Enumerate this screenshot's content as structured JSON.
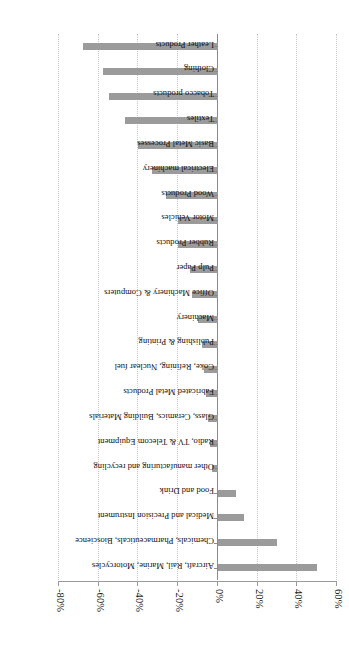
{
  "figure": {
    "orientation": "rotated-90",
    "bar_color": "#9b9b9b",
    "grid_color": "#c8c8c8",
    "axis_color": "#8a8a8a"
  },
  "chart_data": {
    "type": "bar",
    "title": "",
    "subtitle": "",
    "xlabel": "",
    "ylabel": "",
    "orientation": "vertical",
    "grid": true,
    "legend": false,
    "ylim": [
      -80,
      60
    ],
    "ytick_labels": [
      "60%",
      "40%",
      "20%",
      "0%",
      "-20%",
      "-40%",
      "-60%",
      "-80%"
    ],
    "ytick_values": [
      60,
      40,
      20,
      0,
      -20,
      -40,
      -60,
      -80
    ],
    "categories": [
      "Leather Products",
      "Clothing",
      "Tobacco products",
      "Textiles",
      "Basic Metal Processes",
      "Electrical machinery",
      "Wood Products",
      "Motor Vehicles",
      "Rubber Products",
      "Pulp Paper",
      "Office Machinery & Computers",
      "Machinery",
      "Publishing & Printing",
      "Coke, Refining, Nuclear fuel",
      "Fabricated Metal Products",
      "Glass, Ceramics, Building Materials",
      "Radio, TV & Telecom Equipment",
      "Other manufacturing and recycling",
      "Food and Drink",
      "Medical and Precision Instrument",
      "Chemicals, Pharmaceuticals, Bioscience",
      "Aircraft, Rail, Marine, Motorcycles"
    ],
    "values": [
      -68,
      -58,
      -55,
      -47,
      -40,
      -33,
      -26,
      -20,
      -20,
      -14,
      -13,
      -10,
      -8,
      -7,
      -6,
      -5,
      -4,
      -3,
      9,
      13,
      30,
      50
    ]
  }
}
